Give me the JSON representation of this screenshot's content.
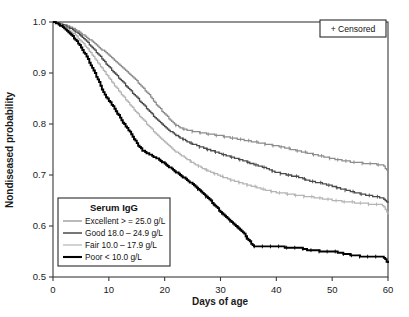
{
  "chart_data": {
    "type": "line",
    "title": "",
    "xlabel": "Days of age",
    "ylabel": "Nondiseased probability",
    "xlim": [
      0,
      60
    ],
    "ylim": [
      0.5,
      1.0
    ],
    "xticks": [
      "0",
      "10",
      "20",
      "30",
      "40",
      "50",
      "60"
    ],
    "yticks": [
      "0.5",
      "0.6",
      "0.7",
      "0.8",
      "0.9",
      "1.0"
    ],
    "grid": false,
    "legend_position": "lower-left",
    "legend_title": "Serum IgG",
    "censor_note": "+ Censored",
    "series": [
      {
        "name": "Excellent > = 25.0 g/L",
        "color": "#8c8c8c",
        "width": 1.25,
        "x": [
          0,
          1,
          2,
          3,
          4,
          5,
          6,
          7,
          8,
          9,
          10,
          11,
          12,
          13,
          14,
          15,
          16,
          17,
          18,
          19,
          20,
          21,
          22,
          23,
          24,
          25,
          26,
          27,
          28,
          30,
          32,
          34,
          36,
          38,
          40,
          42,
          44,
          46,
          48,
          50,
          52,
          54,
          56,
          58,
          59,
          60
        ],
        "y": [
          1.0,
          0.998,
          0.995,
          0.99,
          0.985,
          0.978,
          0.97,
          0.962,
          0.953,
          0.944,
          0.935,
          0.925,
          0.915,
          0.905,
          0.895,
          0.884,
          0.872,
          0.86,
          0.845,
          0.832,
          0.82,
          0.808,
          0.798,
          0.792,
          0.788,
          0.786,
          0.784,
          0.782,
          0.78,
          0.777,
          0.773,
          0.769,
          0.765,
          0.761,
          0.757,
          0.752,
          0.747,
          0.742,
          0.737,
          0.732,
          0.728,
          0.725,
          0.723,
          0.721,
          0.72,
          0.707
        ]
      },
      {
        "name": "Good 18.0 – 24.9 g/L",
        "color": "#4a4a4a",
        "width": 1.3,
        "x": [
          0,
          1,
          2,
          3,
          4,
          5,
          6,
          7,
          8,
          9,
          10,
          11,
          12,
          13,
          14,
          15,
          16,
          17,
          18,
          19,
          20,
          21,
          22,
          23,
          24,
          25,
          26,
          27,
          28,
          30,
          32,
          34,
          36,
          38,
          40,
          42,
          44,
          46,
          48,
          50,
          52,
          54,
          56,
          58,
          59,
          60
        ],
        "y": [
          1.0,
          0.997,
          0.993,
          0.988,
          0.981,
          0.972,
          0.962,
          0.95,
          0.938,
          0.925,
          0.912,
          0.9,
          0.888,
          0.876,
          0.864,
          0.852,
          0.84,
          0.828,
          0.816,
          0.805,
          0.795,
          0.786,
          0.778,
          0.772,
          0.766,
          0.761,
          0.757,
          0.753,
          0.749,
          0.742,
          0.735,
          0.728,
          0.721,
          0.714,
          0.705,
          0.7,
          0.696,
          0.688,
          0.684,
          0.678,
          0.672,
          0.666,
          0.661,
          0.657,
          0.655,
          0.645
        ]
      },
      {
        "name": "Fair 10.0 – 17.9 g/L",
        "color": "#b4b4b4",
        "width": 1.25,
        "x": [
          0,
          1,
          2,
          3,
          4,
          5,
          6,
          7,
          8,
          9,
          10,
          11,
          12,
          13,
          14,
          15,
          16,
          17,
          18,
          19,
          20,
          21,
          22,
          23,
          24,
          25,
          26,
          27,
          28,
          30,
          32,
          34,
          36,
          38,
          40,
          42,
          44,
          46,
          48,
          50,
          52,
          54,
          56,
          58,
          59,
          60
        ],
        "y": [
          1.0,
          0.996,
          0.99,
          0.983,
          0.974,
          0.963,
          0.95,
          0.936,
          0.921,
          0.906,
          0.891,
          0.876,
          0.862,
          0.848,
          0.835,
          0.822,
          0.81,
          0.798,
          0.786,
          0.775,
          0.765,
          0.755,
          0.746,
          0.738,
          0.731,
          0.724,
          0.718,
          0.712,
          0.707,
          0.698,
          0.69,
          0.683,
          0.677,
          0.671,
          0.666,
          0.663,
          0.66,
          0.657,
          0.654,
          0.651,
          0.648,
          0.646,
          0.644,
          0.642,
          0.641,
          0.622
        ]
      },
      {
        "name": "Poor < 10.0 g/L",
        "color": "#000000",
        "width": 1.9,
        "x": [
          0,
          1,
          2,
          3,
          4,
          5,
          6,
          7,
          8,
          9,
          10,
          11,
          12,
          13,
          14,
          15,
          16,
          17,
          18,
          19,
          20,
          21,
          22,
          23,
          24,
          25,
          26,
          27,
          28,
          29,
          30,
          31,
          32,
          33,
          34,
          35,
          36,
          38,
          40,
          42,
          44,
          46,
          48,
          50,
          52,
          54,
          56,
          58,
          59,
          60
        ],
        "y": [
          1.0,
          0.995,
          0.988,
          0.978,
          0.965,
          0.95,
          0.932,
          0.91,
          0.888,
          0.862,
          0.845,
          0.83,
          0.812,
          0.795,
          0.78,
          0.762,
          0.748,
          0.742,
          0.736,
          0.73,
          0.722,
          0.714,
          0.706,
          0.698,
          0.69,
          0.682,
          0.672,
          0.662,
          0.652,
          0.64,
          0.628,
          0.618,
          0.608,
          0.598,
          0.588,
          0.572,
          0.56,
          0.56,
          0.56,
          0.558,
          0.558,
          0.552,
          0.551,
          0.551,
          0.546,
          0.542,
          0.54,
          0.54,
          0.54,
          0.528
        ]
      }
    ]
  },
  "legend": {
    "title": "Serum IgG",
    "items": [
      {
        "label": "Excellent > = 25.0 g/L"
      },
      {
        "label": "Good 18.0 – 24.9 g/L"
      },
      {
        "label": "Fair 10.0 – 17.9 g/L"
      },
      {
        "label": "Poor < 10.0 g/L"
      }
    ]
  },
  "censored_box": {
    "label": "+ Censored"
  },
  "axes": {
    "x_title": "Days of age",
    "y_title": "Nondiseased probability"
  }
}
